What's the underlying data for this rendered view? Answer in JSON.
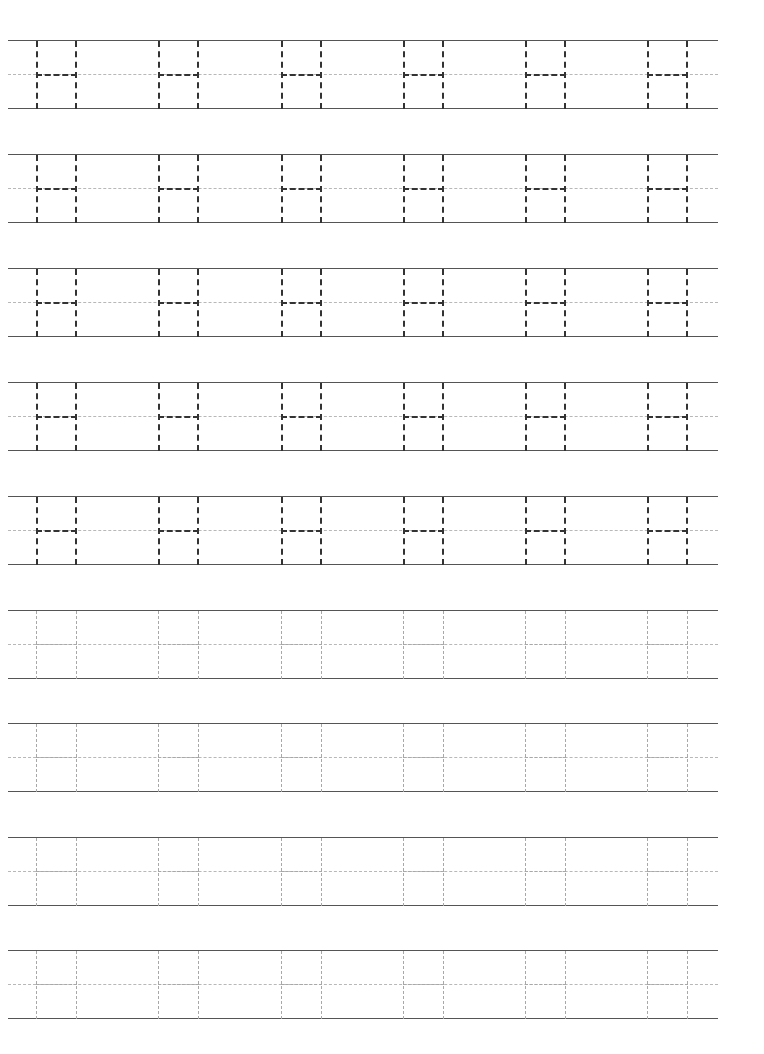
{
  "worksheet": {
    "letter": "H",
    "letters_per_row": 6,
    "letter_x_positions": [
      28,
      150,
      273,
      395,
      517,
      639
    ],
    "rows": [
      {
        "top": 40,
        "style": "dark"
      },
      {
        "top": 154,
        "style": "dark"
      },
      {
        "top": 268,
        "style": "dark"
      },
      {
        "top": 382,
        "style": "dark"
      },
      {
        "top": 496,
        "style": "dark"
      },
      {
        "top": 610,
        "style": "light"
      },
      {
        "top": 723,
        "style": "light"
      },
      {
        "top": 837,
        "style": "light"
      },
      {
        "top": 950,
        "style": "light"
      }
    ],
    "colors": {
      "trace_dark": "#333333",
      "trace_light": "#a8a8a8",
      "guide_line": "#555555",
      "midline": "#b8b8b8"
    }
  }
}
